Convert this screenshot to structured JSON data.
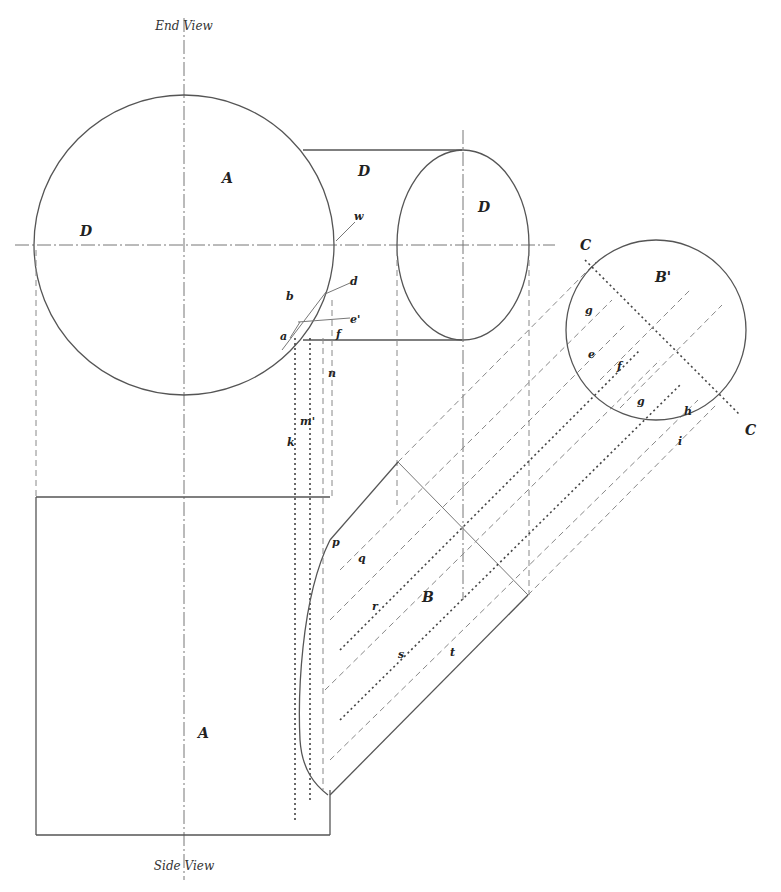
{
  "views": {
    "end_view_title": "End View",
    "side_view_title": "Side View"
  },
  "labels": {
    "A_end": "A",
    "A_side": "A",
    "D_left": "D",
    "D_top": "D",
    "D_ellipse": "D",
    "B_circle": "B'",
    "B_pipe": "B",
    "C_top": "C",
    "C_bottom": "C",
    "w": "w",
    "d": "d",
    "e": "e'",
    "f": "f",
    "a": "a",
    "b": "b",
    "c_small": "c",
    "n": "n",
    "m": "m'",
    "k": "k",
    "p": "p",
    "q": "q",
    "r": "r",
    "s": "s",
    "t": "t",
    "g_circ": "g",
    "e_circ": "e",
    "f_circ": "f",
    "g2_circ": "g",
    "h_circ": "h",
    "i_circ": "i"
  }
}
